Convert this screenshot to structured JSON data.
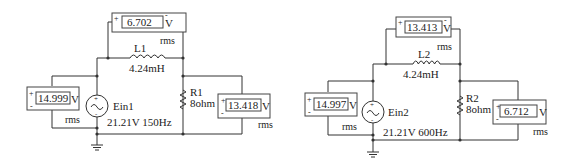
{
  "circuits": [
    {
      "source": {
        "name": "Ein1",
        "spec": "21.21V 150Hz"
      },
      "inductor": {
        "name": "L1",
        "value": "4.24mH"
      },
      "resistor": {
        "name": "R1",
        "value": "8ohm"
      },
      "meters": {
        "inductor": {
          "reading": "6.702",
          "unit": "V",
          "mode": "rms",
          "plus": "+",
          "minus": "-"
        },
        "source": {
          "reading": "14.999",
          "unit": "V",
          "mode": "rms",
          "plus": "+",
          "minus": "-"
        },
        "resistor": {
          "reading": "13.418",
          "unit": "V",
          "mode": "rms",
          "plus": "+",
          "minus": "-"
        }
      }
    },
    {
      "source": {
        "name": "Ein2",
        "spec": "21.21V 600Hz"
      },
      "inductor": {
        "name": "L2",
        "value": "4.24mH"
      },
      "resistor": {
        "name": "R2",
        "value": "8ohm"
      },
      "meters": {
        "inductor": {
          "reading": "13.413",
          "unit": "V",
          "mode": "rms",
          "plus": "+",
          "minus": "-"
        },
        "source": {
          "reading": "14.997",
          "unit": "V",
          "mode": "rms",
          "plus": "+",
          "minus": "-"
        },
        "resistor": {
          "reading": "6.712",
          "unit": "V",
          "mode": "rms",
          "plus": "+",
          "minus": "-"
        }
      }
    }
  ]
}
